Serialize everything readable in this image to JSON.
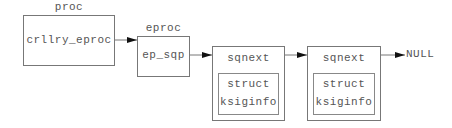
{
  "diagram": {
    "proc": {
      "title": "proc",
      "field": "crllry_eproc"
    },
    "eproc": {
      "title": "eproc",
      "field": "ep_sqp"
    },
    "nodes": [
      {
        "field": "sqnext",
        "inner_line1": "struct",
        "inner_line2": "ksiginfo"
      },
      {
        "field": "sqnext",
        "inner_line1": "struct",
        "inner_line2": "ksiginfo"
      }
    ],
    "terminator": "NULL"
  },
  "colors": {
    "line": "#777777",
    "text": "#555555",
    "arrowhead": "#111111"
  }
}
